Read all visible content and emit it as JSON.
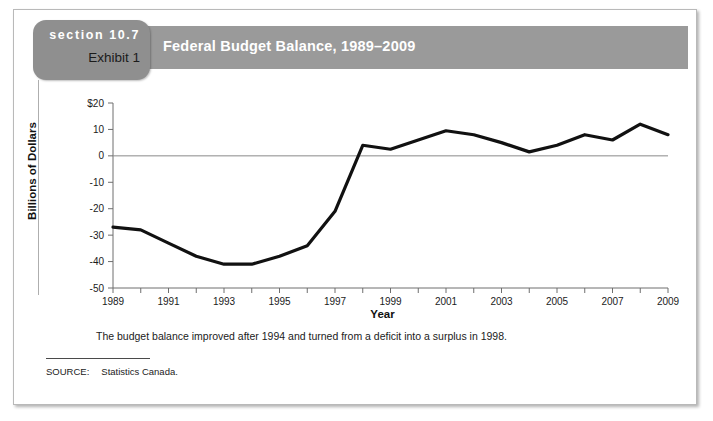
{
  "exhibit": {
    "section_label": "section 10.7",
    "exhibit_label": "Exhibit 1",
    "title": "Federal Budget Balance, 1989–2009",
    "caption": "The budget balance improved after 1994 and turned from a deficit into a surplus in 1998.",
    "source_label": "SOURCE:",
    "source_value": "Statistics Canada."
  },
  "colors": {
    "header_bar": "#9a9a9a",
    "section_tab": "#8f8f8f",
    "line": "#111111",
    "axis": "#6f6f6f",
    "frame": "#b9b9b9"
  },
  "chart_data": {
    "type": "line",
    "title": "Federal Budget Balance, 1989–2009",
    "xlabel": "Year",
    "ylabel": "Billions of Dollars",
    "xlim": [
      1989,
      2009
    ],
    "ylim": [
      -50,
      20
    ],
    "ytick_labels": [
      "$20",
      "10",
      "0",
      "-10",
      "-20",
      "-30",
      "-40",
      "-50"
    ],
    "yticks": [
      20,
      10,
      0,
      -10,
      -20,
      -30,
      -40,
      -50
    ],
    "xtick_labels": [
      "1989",
      "1991",
      "1993",
      "1995",
      "1997",
      "1999",
      "2001",
      "2003",
      "2005",
      "2007",
      "2009"
    ],
    "xticks_all": [
      1989,
      1990,
      1991,
      1992,
      1993,
      1994,
      1995,
      1996,
      1997,
      1998,
      1999,
      2000,
      2001,
      2002,
      2003,
      2004,
      2005,
      2006,
      2007,
      2008,
      2009
    ],
    "grid": false,
    "zero_line": true,
    "legend": "none",
    "x": [
      1989,
      1990,
      1991,
      1992,
      1993,
      1994,
      1995,
      1996,
      1997,
      1998,
      1999,
      2000,
      2001,
      2002,
      2003,
      2004,
      2005,
      2006,
      2007,
      2008,
      2009
    ],
    "values": [
      -27,
      -28,
      -33,
      -38,
      -41,
      -41,
      -38,
      -34,
      -21,
      4,
      2.5,
      6,
      9.5,
      8,
      5,
      1.5,
      4,
      8,
      6,
      12,
      8
    ],
    "series": [
      {
        "name": "Federal Budget Balance",
        "values": [
          -27,
          -28,
          -33,
          -38,
          -41,
          -41,
          -38,
          -34,
          -21,
          4,
          2.5,
          6,
          9.5,
          8,
          5,
          1.5,
          4,
          8,
          6,
          12,
          8
        ]
      }
    ]
  }
}
